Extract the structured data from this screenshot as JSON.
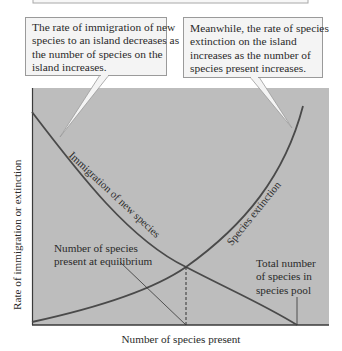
{
  "diagram": {
    "callouts": [
      {
        "id": "immigration-callout",
        "lines": [
          "The rate of immigration of new",
          "species to an island decreases as",
          "the number of species on the",
          "island increases."
        ]
      },
      {
        "id": "extinction-callout",
        "lines": [
          "Meanwhile, the rate of species",
          "extinction on the island",
          "increases as the number of",
          "species present increases."
        ]
      }
    ],
    "curve_labels": {
      "immigration": "Immigration of new species",
      "extinction": "Species extinction"
    },
    "annotations": {
      "equilibrium": [
        "Number of species",
        "present at equilibrium"
      ],
      "species_pool": [
        "Total number",
        "of species in",
        "species pool"
      ]
    },
    "axes": {
      "x_label": "Number of species present",
      "y_label": "Rate of immigration or extinction"
    },
    "colors": {
      "plot_background": "#bdbdbd",
      "curve": "#4a4a4a",
      "callout_fill": "#f4f4f4",
      "callout_border": "#9a9a9a"
    }
  }
}
